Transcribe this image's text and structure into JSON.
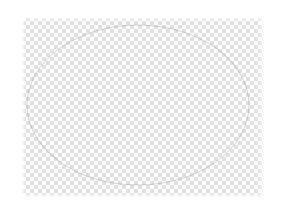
{
  "app": {
    "canvas": {
      "name": "image-canvas",
      "x": 22,
      "y": 17,
      "width": 241,
      "height": 180,
      "background_mode": "transparent"
    },
    "background": {
      "type": "transparency-checkerboard",
      "cell_size_px": 4,
      "light_color": "#ffffff",
      "dark_color": "#d5d5d5"
    },
    "page_background_color": "#ffffff",
    "shapes": [
      {
        "name": "ellipse",
        "type": "ellipse",
        "center_x": 116,
        "center_y": 88,
        "radius_x": 111,
        "radius_y": 80,
        "stroke_color": "#9b9b9b",
        "stroke_width": 1,
        "fill": "none",
        "opacity": 0.45
      }
    ]
  }
}
